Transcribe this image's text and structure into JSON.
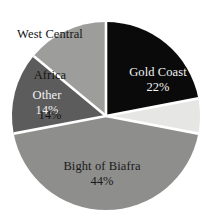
{
  "chart_data": {
    "type": "pie",
    "title": "",
    "subtitle": "",
    "xlabel": "",
    "ylabel": "",
    "legend_position": "none",
    "grid": false,
    "units": "percent",
    "categories": [
      "Gold Coast",
      "Bight of Biafra",
      "Other",
      "West Central Africa"
    ],
    "values": [
      22,
      44,
      14,
      14
    ],
    "slices": [
      {
        "name": "Gold Coast",
        "label": "Gold Coast",
        "value": 22,
        "value_label": "22%",
        "color": "#0a0a0a",
        "label_color": "#f2f2f2",
        "label_placement": "inside",
        "start_angle_deg": 0,
        "end_angle_deg": 79.2
      },
      {
        "name": "unlabeled-light-slice",
        "label": "",
        "value": 6,
        "value_label": "",
        "color": "#e6e6e4",
        "label_color": "#1a1a1a",
        "label_placement": "none",
        "start_angle_deg": 79.2,
        "end_angle_deg": 100.8
      },
      {
        "name": "Bight of Biafra",
        "label": "Bight of Biafra",
        "value": 44,
        "value_label": "44%",
        "color": "#8e8e8c",
        "label_color": "#1a1a1a",
        "label_placement": "inside",
        "start_angle_deg": 100.8,
        "end_angle_deg": 259.2
      },
      {
        "name": "Other",
        "label": "Other",
        "value": 14,
        "value_label": "14%",
        "color": "#5c5c5c",
        "label_color": "#f2f2f2",
        "label_placement": "inside",
        "start_angle_deg": 259.2,
        "end_angle_deg": 309.6
      },
      {
        "name": "West Central Africa",
        "label": "West Central\nAfrica",
        "value": 14,
        "value_label": "14%",
        "color": "#9d9d9b",
        "label_color": "#151515",
        "label_placement": "outside",
        "start_angle_deg": 309.6,
        "end_angle_deg": 360
      }
    ]
  },
  "labels": {
    "west_central_africa": {
      "line1": "West Central",
      "line2": "Africa",
      "percent": "14%"
    },
    "gold_coast": {
      "name": "Gold Coast",
      "percent": "22%"
    },
    "other": {
      "name": "Other",
      "percent": "14%"
    },
    "bight_of_biafra": {
      "name": "Bight of Biafra",
      "percent": "44%"
    }
  },
  "style": {
    "background": "#ffffff",
    "separator_color": "#ffffff",
    "center_x": 106,
    "center_y": 116,
    "radius": 94
  }
}
